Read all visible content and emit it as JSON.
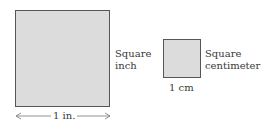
{
  "square_inch": {
    "label_line1": "Square",
    "label_line2": "inch",
    "dimension": "1 in.",
    "fill": "#dcdcdc",
    "border": "#555555"
  },
  "square_centimeter": {
    "label_line1": "Square",
    "label_line2": "centimeter",
    "dimension": "1 cm",
    "fill": "#dcdcdc",
    "border": "#555555"
  }
}
